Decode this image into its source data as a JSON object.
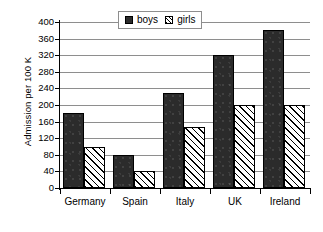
{
  "chart_data": {
    "type": "bar",
    "title": "",
    "subtitle": "",
    "xlabel": "",
    "ylabel": "Admission per 100 K",
    "categories": [
      "Germany",
      "Spain",
      "Italy",
      "UK",
      "Ireland"
    ],
    "series": [
      {
        "name": "boys",
        "values": [
          180,
          80,
          230,
          320,
          380
        ],
        "color": "#2b2b2b",
        "fill": "solid"
      },
      {
        "name": "girls",
        "values": [
          100,
          40,
          148,
          200,
          200
        ],
        "color": "#ffffff",
        "fill": "diagonal-hatch"
      }
    ],
    "ylim": [
      0,
      400
    ],
    "ytick_step": 40,
    "ytick_labels": [
      "400",
      "360",
      "320",
      "280",
      "240",
      "200",
      "160",
      "120",
      "80",
      "40",
      "0"
    ],
    "grid": true,
    "grid_axis": "y",
    "legend": {
      "position": "top-center",
      "entries": [
        "boys",
        "girls"
      ]
    }
  }
}
